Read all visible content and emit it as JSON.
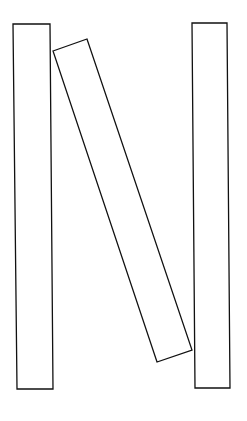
{
  "canvas": {
    "width": 247,
    "height": 421,
    "background": "#ffffff"
  },
  "stroke": "#111111",
  "shapes": [
    {
      "name": "left-board",
      "points": "13,24 50,24 53,389 17,389"
    },
    {
      "name": "leaning-board",
      "points": "53,51 87,39 192,350 157,362"
    },
    {
      "name": "right-board",
      "points": "192,23 227,23 230,388 195,388"
    }
  ]
}
